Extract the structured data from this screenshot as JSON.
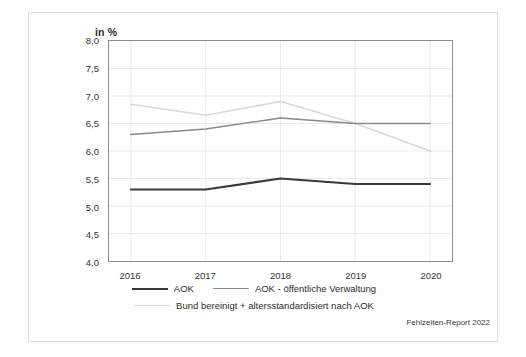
{
  "figure": {
    "axis_title": "in %",
    "source_note": "Fehlzeiten-Report 2022",
    "frame_color": "#dcdcdc",
    "plot_border_color": "#8d8d8d",
    "grid_color": "#e9e9e9"
  },
  "legend": {
    "position": "bottom-center",
    "rows": [
      [
        {
          "label": "AOK",
          "color": "#3a3a3a",
          "width": 2.1
        },
        {
          "label": "AOK - öffentliche Verwaltung",
          "color": "#8a8a8a",
          "width": 1.5
        }
      ],
      [
        {
          "label": "Bund bereinigt + altersstandardisiert nach AOK",
          "color": "#d8d8d8",
          "width": 1.5
        }
      ]
    ]
  },
  "chart_data": {
    "type": "line",
    "title": "",
    "subtitle": "",
    "xlabel": "",
    "ylabel": "in %",
    "categories": [
      "2016",
      "2017",
      "2018",
      "2019",
      "2020"
    ],
    "ylim": [
      4.0,
      8.0
    ],
    "ytick_step": 0.5,
    "yticks": [
      "8,0",
      "7,5",
      "7,0",
      "6,5",
      "6,0",
      "5,5",
      "5,0",
      "4,5",
      "4,0"
    ],
    "ytick_values": [
      8.0,
      7.5,
      7.0,
      6.5,
      6.0,
      5.5,
      5.0,
      4.5,
      4.0
    ],
    "grid": true,
    "grid_axis": "both",
    "legend_position": "bottom",
    "series": [
      {
        "name": "AOK",
        "color": "#3a3a3a",
        "width": 2.1,
        "values": [
          5.3,
          5.3,
          5.5,
          5.4,
          5.4
        ]
      },
      {
        "name": "AOK - öffentliche Verwaltung",
        "color": "#8a8a8a",
        "width": 1.5,
        "values": [
          6.3,
          6.4,
          6.6,
          6.5,
          6.5
        ]
      },
      {
        "name": "Bund bereinigt + altersstandardisiert nach AOK",
        "color": "#d8d8d8",
        "width": 1.5,
        "values": [
          6.85,
          6.65,
          6.9,
          6.5,
          6.0
        ]
      }
    ]
  }
}
